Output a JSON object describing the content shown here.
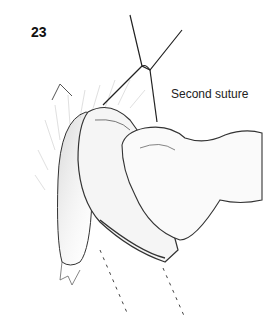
{
  "figure": {
    "number": "23",
    "labels": [
      {
        "text": "Second suture",
        "target": "suture-junction"
      }
    ],
    "style": "pencil surgical illustration",
    "colors": {
      "ink": "#222222",
      "shade": "#8a8a8a",
      "background": "#ffffff"
    }
  }
}
